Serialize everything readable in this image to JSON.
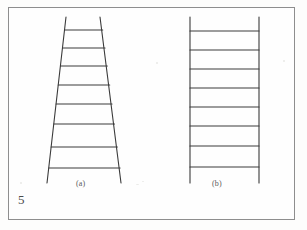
{
  "figure": {
    "page_number": "5",
    "background_color": "#fdfdfc",
    "frame_color": "#8e8e8e",
    "line_color": "#3a3a3a",
    "caption_color": "#5a5a5a",
    "panels": [
      {
        "id": "a",
        "label": "(a)",
        "shape": "trapezoid",
        "description": "converging-rails ladder",
        "rail_left": {
          "x1": 66.0,
          "y1": 17.0,
          "x2": 47.0,
          "y2": 183.0
        },
        "rail_right": {
          "x1": 100.0,
          "y1": 17.0,
          "x2": 121.0,
          "y2": 183.0
        },
        "rung_count": 8,
        "rungs": [
          {
            "index": 1,
            "y": 30.0,
            "x_left": 64.6,
            "x_right": 102.7
          },
          {
            "index": 2,
            "y": 48.0,
            "x_left": 62.5,
            "x_right": 105.0
          },
          {
            "index": 3,
            "y": 66.0,
            "x_left": 60.5,
            "x_right": 107.3
          },
          {
            "index": 4,
            "y": 85.0,
            "x_left": 58.3,
            "x_right": 109.7
          },
          {
            "index": 5,
            "y": 104.0,
            "x_left": 56.1,
            "x_right": 112.0
          },
          {
            "index": 6,
            "y": 124.0,
            "x_left": 53.8,
            "x_right": 114.5
          },
          {
            "index": 7,
            "y": 147.0,
            "x_left": 51.2,
            "x_right": 117.4
          },
          {
            "index": 8,
            "y": 168.0,
            "x_left": 48.8,
            "x_right": 120.1
          }
        ]
      },
      {
        "id": "b",
        "label": "(b)",
        "shape": "rectangle",
        "description": "parallel-rails ladder",
        "rail_left": {
          "x1": 190.0,
          "y1": 17.0,
          "x2": 190.0,
          "y2": 183.0
        },
        "rail_right": {
          "x1": 259.0,
          "y1": 17.0,
          "x2": 259.0,
          "y2": 183.0
        },
        "rung_count": 8,
        "rungs": [
          {
            "index": 1,
            "y": 31.0,
            "x_left": 190.0,
            "x_right": 259.0
          },
          {
            "index": 2,
            "y": 50.0,
            "x_left": 190.0,
            "x_right": 259.0
          },
          {
            "index": 3,
            "y": 69.0,
            "x_left": 190.0,
            "x_right": 259.0
          },
          {
            "index": 4,
            "y": 88.0,
            "x_left": 190.0,
            "x_right": 259.0
          },
          {
            "index": 5,
            "y": 107.0,
            "x_left": 190.0,
            "x_right": 259.0
          },
          {
            "index": 6,
            "y": 126.0,
            "x_left": 190.0,
            "x_right": 259.0
          },
          {
            "index": 7,
            "y": 146.0,
            "x_left": 190.0,
            "x_right": 259.0
          },
          {
            "index": 8,
            "y": 167.0,
            "x_left": 190.0,
            "x_right": 259.0
          }
        ]
      }
    ]
  }
}
